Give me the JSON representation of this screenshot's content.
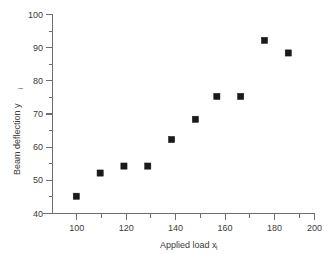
{
  "chart_data": {
    "type": "scatter",
    "title": "",
    "xlabel": "Applied load x",
    "xlabel_sub": "i",
    "ylabel": "Beam deflection y",
    "ylabel_sub": "i",
    "xlim": [
      90,
      200
    ],
    "ylim": [
      40,
      100
    ],
    "grid": false,
    "legend": null,
    "x_major_ticks": [
      100,
      120,
      140,
      160,
      180,
      200
    ],
    "x_minor_ticks": [
      110,
      130,
      150,
      170,
      190
    ],
    "x_tick_labels": [
      "100",
      "120",
      "140",
      "160",
      "180",
      "200"
    ],
    "y_major_ticks": [
      40,
      50,
      60,
      70,
      80,
      90,
      100
    ],
    "y_minor_ticks": [
      45,
      55,
      65,
      75,
      85,
      95
    ],
    "y_tick_labels": [
      "40",
      "50",
      "60",
      "70",
      "80",
      "90",
      "100"
    ],
    "marker_shape": "square",
    "marker_color": "#1a1a1a",
    "points": [
      {
        "x": 100,
        "y": 45.2
      },
      {
        "x": 110,
        "y": 52.2
      },
      {
        "x": 120,
        "y": 54.3
      },
      {
        "x": 130,
        "y": 54.3
      },
      {
        "x": 140,
        "y": 62.3
      },
      {
        "x": 150,
        "y": 68.4
      },
      {
        "x": 159,
        "y": 75.3
      },
      {
        "x": 169,
        "y": 75.3
      },
      {
        "x": 179,
        "y": 92.2
      },
      {
        "x": 189,
        "y": 88.4
      }
    ]
  },
  "axes": {
    "x_title": "Applied load x",
    "x_title_sub": "i",
    "y_title": "Beam deflection y",
    "y_title_sub": "i"
  }
}
